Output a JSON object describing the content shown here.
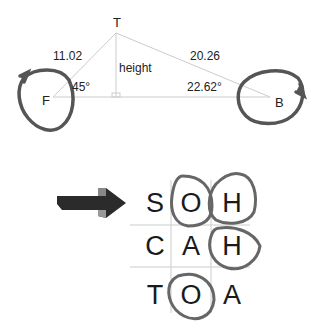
{
  "triangle": {
    "vertices": {
      "top": "T",
      "left": "F",
      "right": "B"
    },
    "sides": {
      "left": "11.02",
      "right": "20.26"
    },
    "height_label": "height",
    "angles": {
      "left": "45°",
      "right": "22.62°"
    }
  },
  "mnemonic": {
    "rows": [
      [
        "S",
        "O",
        "H"
      ],
      [
        "C",
        "A",
        "H"
      ],
      [
        "T",
        "O",
        "A"
      ]
    ],
    "circled": [
      "0-1",
      "0-2",
      "1-2",
      "2-1"
    ]
  },
  "colors": {
    "line": "#cccccc",
    "circle": "#555555",
    "text": "#222222",
    "arrow": "#2b2b2b"
  }
}
